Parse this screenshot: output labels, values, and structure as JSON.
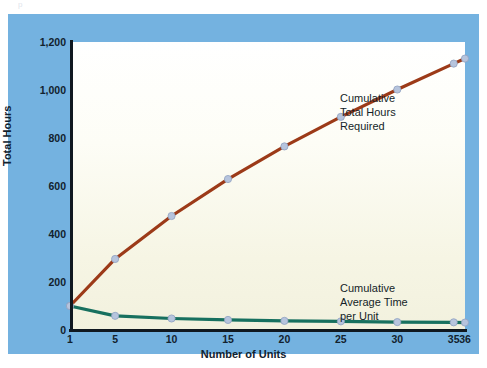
{
  "figure": {
    "ghost_text_top": "p",
    "panel_color": "#74b2e0",
    "plot_bg_top": "#ffffff",
    "plot_bg_bottom": "#f2f1de"
  },
  "annotations": {
    "total_hours_label": "Cumulative\nTotal Hours\nRequired",
    "average_time_label": "Cumulative\nAverage Time\nper Unit"
  },
  "axes": {
    "y_label": "Total Hours",
    "x_label": "Number of Units",
    "y_ticks": [
      "0",
      "200",
      "400",
      "600",
      "800",
      "1,000",
      "1,200"
    ],
    "x_ticks": [
      "1",
      "5",
      "10",
      "15",
      "20",
      "25",
      "30",
      "35",
      "36"
    ]
  },
  "chart_data": {
    "type": "line",
    "title": "",
    "subtitle": "",
    "xlabel": "Number of Units",
    "ylabel": "Total Hours",
    "xlim": [
      1,
      36
    ],
    "ylim": [
      0,
      1200
    ],
    "grid": false,
    "legend": "annotations-inline",
    "x": [
      1,
      5,
      10,
      15,
      20,
      25,
      30,
      35,
      36
    ],
    "series": [
      {
        "name": "Cumulative Total Hours Required",
        "color": "#9c3a18",
        "marker_color": "#b6c4dd",
        "values": [
          100,
          296,
          475,
          629,
          765,
          888,
          1002,
          1110,
          1131
        ]
      },
      {
        "name": "Cumulative Average Time per Unit",
        "color": "#17705f",
        "marker_color": "#b6c4dd",
        "values": [
          100,
          59,
          48,
          42,
          38,
          36,
          33,
          32,
          31
        ]
      }
    ]
  },
  "ghost_lines": [
    {
      "top": 62,
      "text": ""
    },
    {
      "top": 76,
      "text": ""
    },
    {
      "top": 90,
      "text": ""
    },
    {
      "top": 166,
      "text": ""
    },
    {
      "top": 180,
      "text": ""
    },
    {
      "top": 194,
      "text": ""
    },
    {
      "top": 208,
      "text": ""
    },
    {
      "top": 222,
      "text": ""
    },
    {
      "top": 236,
      "text": ""
    },
    {
      "top": 250,
      "text": ""
    }
  ]
}
